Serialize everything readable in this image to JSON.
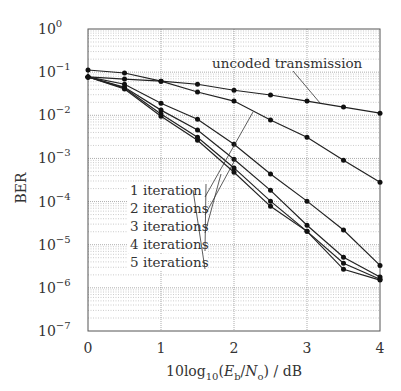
{
  "chart_data": {
    "type": "line",
    "title": "",
    "xlabel": "10log10(Eb/No) / dB",
    "ylabel": "BER",
    "xlim": [
      0,
      4
    ],
    "ylim": [
      1e-07,
      1
    ],
    "yscale": "log",
    "grid": true,
    "x_ticks": [
      "0",
      "1",
      "2",
      "3",
      "4"
    ],
    "y_ticks": [
      "10^0",
      "10^-1",
      "10^-2",
      "10^-3",
      "10^-4",
      "10^-5",
      "10^-6",
      "10^-7"
    ],
    "x": [
      0,
      0.5,
      1,
      1.5,
      2,
      2.5,
      3,
      3.5,
      4
    ],
    "series": [
      {
        "name": "uncoded transmission",
        "log10_values": [
          -0.95,
          -1.02,
          -1.21,
          -1.28,
          -1.42,
          -1.53,
          -1.67,
          -1.81,
          -1.95
        ]
      },
      {
        "name": "1 iteration",
        "log10_values": [
          -1.11,
          -1.16,
          -1.21,
          -1.46,
          -1.67,
          -2.11,
          -2.51,
          -3.04,
          -3.55
        ]
      },
      {
        "name": "2 iterations",
        "log10_values": [
          -1.11,
          -1.28,
          -1.72,
          -2.09,
          -2.67,
          -3.36,
          -3.99,
          -4.66,
          -5.48
        ]
      },
      {
        "name": "3 iterations",
        "log10_values": [
          -1.11,
          -1.35,
          -1.88,
          -2.34,
          -3.02,
          -3.74,
          -4.55,
          -5.29,
          -5.75
        ]
      },
      {
        "name": "4 iterations",
        "log10_values": [
          -1.11,
          -1.37,
          -1.97,
          -2.51,
          -3.22,
          -3.99,
          -4.69,
          -5.43,
          -5.8
        ]
      },
      {
        "name": "5 iterations",
        "log10_values": [
          -1.11,
          -1.39,
          -2.02,
          -2.58,
          -3.32,
          -4.11,
          -4.69,
          -5.57,
          -5.82
        ]
      }
    ],
    "annotations": [
      {
        "text": "uncoded transmission",
        "target_series": 0
      },
      {
        "text": "1 iteration",
        "target_series": 1
      },
      {
        "text": "2 iterations",
        "target_series": 2
      },
      {
        "text": "3 iterations",
        "target_series": 3
      },
      {
        "text": "4 iterations",
        "target_series": 4
      },
      {
        "text": "5 iterations",
        "target_series": 5
      }
    ]
  }
}
